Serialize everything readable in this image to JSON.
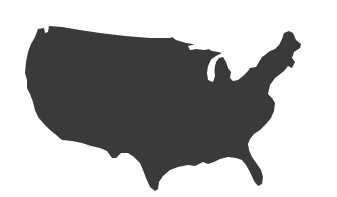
{
  "image": {
    "subject": "Silhouette of the contiguous United States",
    "background_color": "#ffffff",
    "fill_color": "#3a3a3a"
  }
}
